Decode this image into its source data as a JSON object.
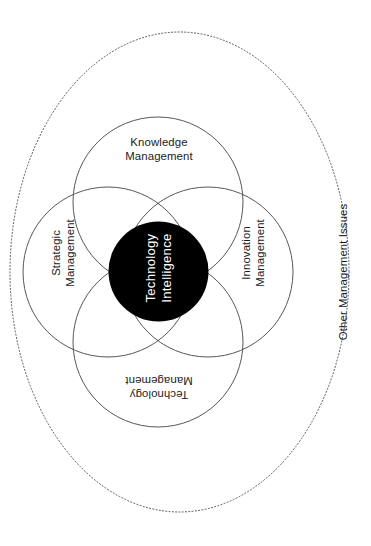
{
  "diagram": {
    "title": "Technology Intelligence",
    "type": "venn",
    "canvas": {
      "width": 371,
      "height": 546,
      "background": "#ffffff"
    },
    "colors": {
      "stroke": "#444444",
      "dotted_stroke": "#555555",
      "core_fill": "#000000",
      "core_text": "#ffffff",
      "label_text": "#1a1a1a",
      "background": "#ffffff"
    },
    "core": {
      "label": "Technology\nIntelligence",
      "line1": "Technology",
      "line2": "Intelligence",
      "shape": "filled-circle",
      "fill": "#000000",
      "text_color": "#ffffff",
      "rotation_deg": -90,
      "center": {
        "x": 158.5,
        "y": 271.5
      },
      "radius": 50
    },
    "circles": [
      {
        "id": "knowledge-management",
        "label": "Knowledge\nManagement",
        "line1": "Knowledge",
        "line2": "Management",
        "position": "top",
        "rotation_deg": 0,
        "center": {
          "x": 158,
          "y": 202
        },
        "radius": 85
      },
      {
        "id": "strategic-management",
        "label": "Strategic\nManagement",
        "line1": "Strategic",
        "line2": "Management",
        "position": "left",
        "rotation_deg": -90,
        "center": {
          "x": 108,
          "y": 272
        },
        "radius": 85
      },
      {
        "id": "innovation-management",
        "label": "Innovation\nManagement",
        "line1": "Innovation",
        "line2": "Management",
        "position": "right",
        "rotation_deg": -90,
        "center": {
          "x": 208,
          "y": 272
        },
        "radius": 85
      },
      {
        "id": "technology-management",
        "label": "Technology\nManagement",
        "line1": "Technology",
        "line2": "Management",
        "position": "bottom",
        "rotation_deg": 180,
        "center": {
          "x": 158,
          "y": 342
        },
        "radius": 85
      }
    ],
    "outer_boundary": {
      "id": "other-management-issues",
      "label": "Other Management Issues",
      "shape": "dotted-ellipse",
      "rotation_deg": -90,
      "center": {
        "x": 179.5,
        "y": 272
      },
      "radius_x": 169.5,
      "radius_y": 240,
      "stroke_style": "dotted"
    }
  }
}
